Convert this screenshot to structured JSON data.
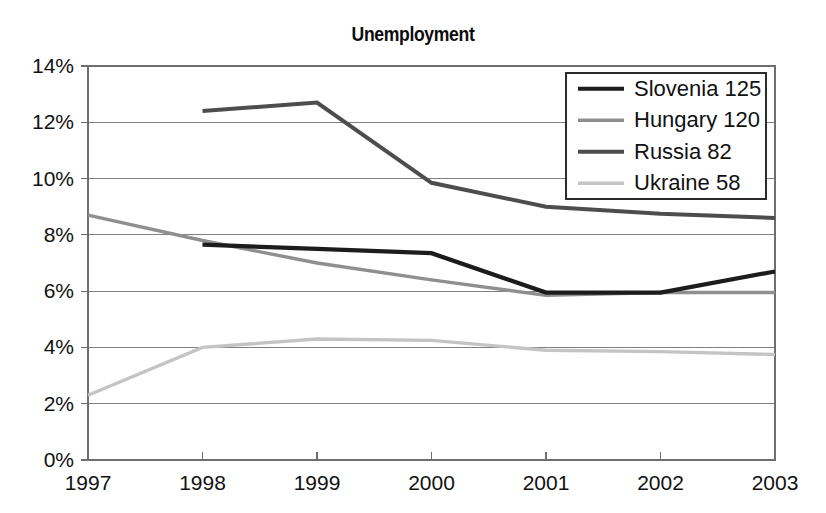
{
  "chart_data": {
    "type": "line",
    "title": "Unemployment",
    "xlabel": "",
    "ylabel": "",
    "x": [
      "1997",
      "1998",
      "1999",
      "2000",
      "2001",
      "2002",
      "2003"
    ],
    "categories": [
      "1997",
      "1998",
      "1999",
      "2000",
      "2001",
      "2002",
      "2003"
    ],
    "ylim": [
      0,
      14
    ],
    "yticks": [
      0,
      2,
      4,
      6,
      8,
      10,
      12,
      14
    ],
    "ytick_labels": [
      "0%",
      "2%",
      "4%",
      "6%",
      "8%",
      "10%",
      "12%",
      "14%"
    ],
    "xtick_labels": [
      "1997",
      "1998",
      "1999",
      "2000",
      "2001",
      "2002",
      "2003"
    ],
    "grid": true,
    "legend_position": "upper-right-inside",
    "series": [
      {
        "name": "Slovenia 125",
        "legend_label": "Slovenia 125",
        "color": "#1c1c1c",
        "width": 4.2,
        "values": [
          null,
          7.65,
          7.5,
          7.35,
          5.95,
          5.95,
          6.7
        ]
      },
      {
        "name": "Hungary 120",
        "legend_label": "Hungary 120",
        "color": "#8f8f8f",
        "width": 3.4,
        "values": [
          8.7,
          7.8,
          7.0,
          6.4,
          5.85,
          5.95,
          5.95
        ]
      },
      {
        "name": "Russia 82",
        "legend_label": "Russia 82",
        "color": "#4d4d4d",
        "width": 4.0,
        "values": [
          null,
          12.4,
          12.7,
          9.85,
          9.0,
          8.75,
          8.6
        ]
      },
      {
        "name": "Ukraine 58",
        "legend_label": "Ukraine 58",
        "color": "#c4c4c4",
        "width": 3.4,
        "values": [
          2.3,
          4.0,
          4.3,
          4.25,
          3.9,
          3.85,
          3.75
        ]
      }
    ]
  },
  "layout": {
    "plot_left": 88,
    "plot_right": 775,
    "plot_top": 66,
    "plot_bottom": 460,
    "legend": {
      "x": 566,
      "y": 73,
      "width": 200,
      "height": 126
    }
  }
}
